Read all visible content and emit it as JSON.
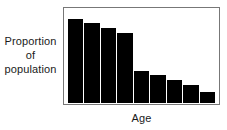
{
  "chart_data": {
    "type": "bar",
    "title": "",
    "subtitle": "",
    "xlabel": "Age",
    "ylabel": "Proportion of population",
    "ylabel_lines": [
      "Proportion",
      "of",
      "population"
    ],
    "categories": [
      "1",
      "2",
      "3",
      "4",
      "5",
      "6",
      "7",
      "8",
      "9"
    ],
    "values": [
      88,
      83,
      78,
      73,
      33,
      29,
      24,
      19,
      12
    ],
    "ylim": [
      0,
      98
    ],
    "xlim": [
      0,
      9
    ],
    "grid": false,
    "legend": false,
    "legend_position": "none",
    "bar_color": "#000000",
    "frame_color": "#777777",
    "background_color": "#ffffff",
    "text_color": "#1a1a1a",
    "annotations": [],
    "tick_labels_x": [],
    "tick_labels_y": []
  }
}
